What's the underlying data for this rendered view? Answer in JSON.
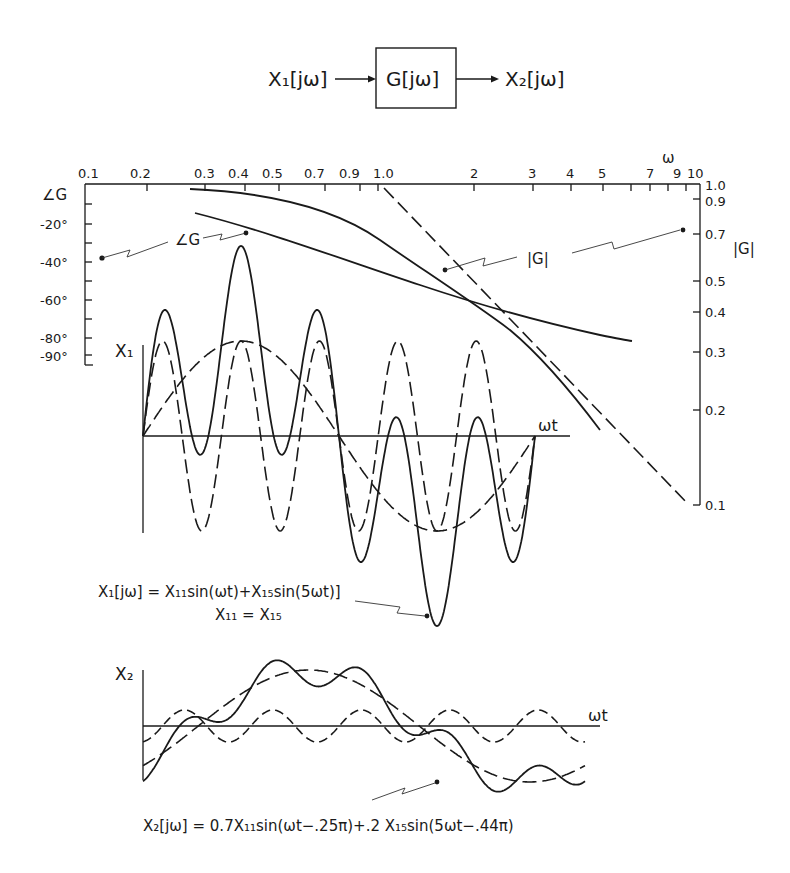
{
  "block_diagram": {
    "input_label": "X₁[jω]",
    "block_label": "G[jω]",
    "output_label": "X₂[jω]"
  },
  "bode": {
    "freq_axis_label": "ω",
    "freq_ticks": [
      "0.1",
      "0.2",
      "0.3",
      "0.4",
      "0.5",
      "0.7",
      "0.9",
      "1.0",
      "2",
      "3",
      "4",
      "5",
      "7",
      "9",
      "10"
    ],
    "phase_axis_title": "∠G",
    "phase_ticks": [
      "-20°",
      "-40°",
      "-60°",
      "-80°",
      "-90°"
    ],
    "mag_axis_title": "|G|",
    "mag_ticks": [
      "1.0",
      "0.9",
      "0.7",
      "0.5",
      "0.4",
      "0.3",
      "0.2",
      "0.1"
    ],
    "phase_curve_label": "∠G",
    "mag_curve_label": "|G|"
  },
  "x1_plot": {
    "y_label": "X₁",
    "x_label": "ωt",
    "equation": "X₁[jω] = X₁₁sin(ωt)+X₁₅sin(5ωt)]",
    "condition": "X₁₁ = X₁₅"
  },
  "x2_plot": {
    "y_label": "X₂",
    "x_label": "ωt",
    "equation": "X₂[jω] = 0.7X₁₁sin(ωt−.25π)+.2 X₁₅sin(5ωt−.44π)"
  },
  "chart_data": [
    {
      "type": "line",
      "title": "Bode plot of G[jω]",
      "xlabel": "ω",
      "xscale": "log",
      "xlim": [
        0.1,
        10
      ],
      "series": [
        {
          "name": "|G| (actual)",
          "axis": "right",
          "x": [
            0.28,
            0.5,
            1.0,
            2.0,
            3.0
          ],
          "values": [
            0.98,
            0.92,
            0.78,
            0.42,
            0.19
          ]
        },
        {
          "name": "|G| (asymptote, dashed)",
          "axis": "right",
          "x": [
            1.0,
            2.0,
            5.0,
            9.0
          ],
          "values": [
            1.0,
            0.5,
            0.2,
            0.1
          ]
        },
        {
          "name": "∠G",
          "axis": "left",
          "x": [
            0.29,
            0.5,
            1.0,
            2.0,
            5.0
          ],
          "values": [
            -15,
            -30,
            -45,
            -63,
            -80
          ]
        }
      ],
      "ylabel_left": "∠G (deg)",
      "ylim_left": [
        -90,
        0
      ],
      "ylabel_right": "|G|",
      "yscale_right": "log",
      "ylim_right": [
        0.1,
        1.0
      ]
    },
    {
      "type": "line",
      "title": "Input X₁",
      "xlabel": "ωt",
      "series": [
        {
          "name": "X₁₁sin(ωt)",
          "style": "dashed"
        },
        {
          "name": "X₁₅sin(5ωt)",
          "style": "dashed"
        },
        {
          "name": "X₁ sum",
          "style": "solid"
        }
      ]
    },
    {
      "type": "line",
      "title": "Output X₂",
      "xlabel": "ωt",
      "series": [
        {
          "name": "0.7X₁₁sin(ωt−.25π)",
          "style": "dashed"
        },
        {
          "name": ".2X₁₅sin(5ωt−.44π)",
          "style": "dashed"
        },
        {
          "name": "X₂ sum",
          "style": "solid"
        }
      ]
    }
  ]
}
